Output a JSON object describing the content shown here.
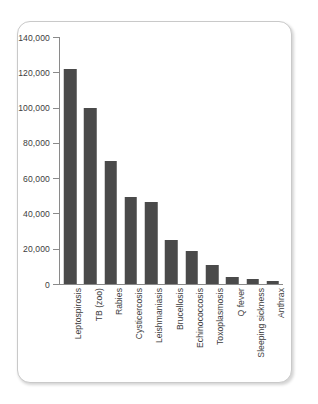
{
  "chart_data": {
    "type": "bar",
    "title": "",
    "subtitle": "",
    "xlabel": "",
    "ylabel": "",
    "ylim": [
      0,
      140000
    ],
    "grid": false,
    "legend": false,
    "orientation": "vertical",
    "bar_color": "#4a4a4a",
    "axis_color": "#8a8a8a",
    "text_color": "#3d3d3d",
    "y_ticks": [
      0,
      20000,
      40000,
      60000,
      80000,
      100000,
      120000,
      140000
    ],
    "y_tick_labels": [
      "0",
      "20,000",
      "40,000",
      "60,000",
      "80,000",
      "100,000",
      "120,000",
      "140,000"
    ],
    "categories": [
      "Leptospirosis",
      "TB (zoo)",
      "Rabies",
      "Cysticercosis",
      "Leishmaniasis",
      "Brucellosis",
      "Echinococcosis",
      "Toxoplasmosis",
      "Q fever",
      "Sleeping sickness",
      "Anthrax"
    ],
    "values": [
      122000,
      100000,
      70000,
      49500,
      46500,
      25000,
      18500,
      10500,
      4000,
      3000,
      1500
    ]
  }
}
